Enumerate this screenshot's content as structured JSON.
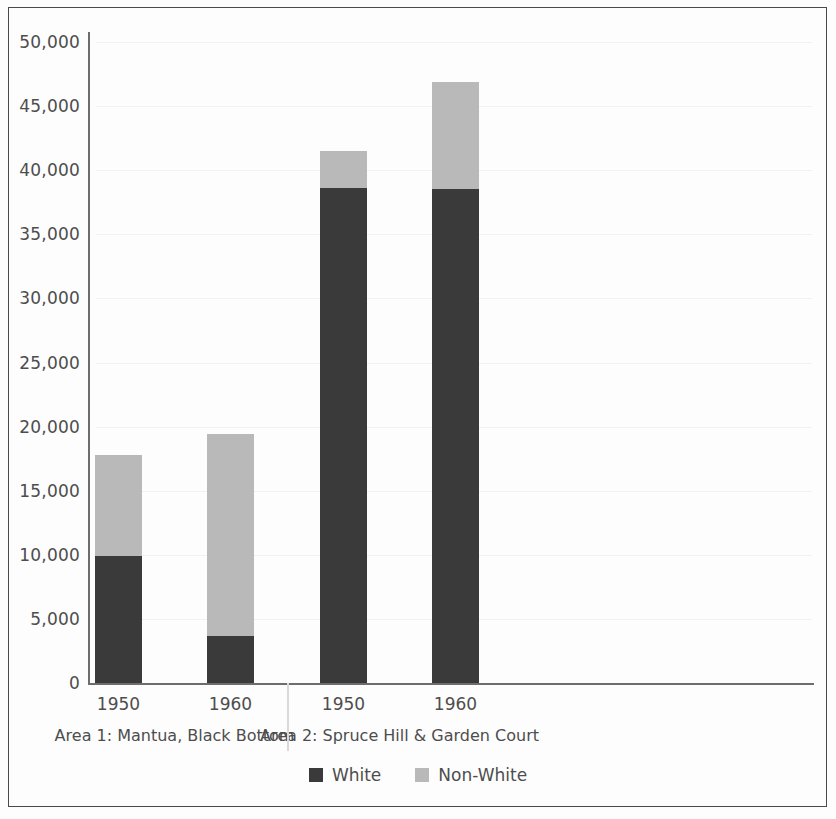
{
  "chart_data": {
    "type": "bar",
    "subtype": "stacked-bar-grouped",
    "title": "",
    "xlabel": "",
    "ylabel": "",
    "ylim": [
      0,
      50000
    ],
    "ytick_step": 5000,
    "ytick_labels": [
      "50,000",
      "45,000",
      "40,000",
      "35,000",
      "30,000",
      "25,000",
      "20,000",
      "15,000",
      "10,000",
      "5,000",
      "0"
    ],
    "ytick_values": [
      50000,
      45000,
      40000,
      35000,
      30000,
      25000,
      20000,
      15000,
      10000,
      5000,
      0
    ],
    "grid": true,
    "legend_position": "bottom-center",
    "categories": [
      "1950",
      "1960",
      "1950",
      "1960"
    ],
    "groups": [
      {
        "label": "Area 1: Mantua, Black Bottom",
        "categories": [
          "1950",
          "1960"
        ]
      },
      {
        "label": "Area 2: Spruce Hill & Garden Court",
        "categories": [
          "1950",
          "1960"
        ]
      }
    ],
    "series": [
      {
        "name": "White",
        "color": "#3a3a3a",
        "values": [
          9900,
          3700,
          38600,
          38500
        ]
      },
      {
        "name": "Non-White",
        "color": "#b9b9b9",
        "values": [
          7900,
          15700,
          2900,
          8400
        ]
      }
    ],
    "totals": [
      17800,
      19400,
      41500,
      46900
    ],
    "bars": [
      {
        "group": "Area 1: Mantua, Black Bottom",
        "category": "1950",
        "white": 9900,
        "non_white": 7900,
        "total": 17800
      },
      {
        "group": "Area 1: Mantua, Black Bottom",
        "category": "1960",
        "white": 3700,
        "non_white": 15700,
        "total": 19400
      },
      {
        "group": "Area 2: Spruce Hill & Garden Court",
        "category": "1950",
        "white": 38600,
        "non_white": 2900,
        "total": 41500
      },
      {
        "group": "Area 2: Spruce Hill & Garden Court",
        "category": "1960",
        "white": 38500,
        "non_white": 8400,
        "total": 46900
      }
    ]
  },
  "legend": {
    "items": [
      {
        "label": "White",
        "color": "#3a3a3a"
      },
      {
        "label": "Non-White",
        "color": "#b9b9b9"
      }
    ]
  },
  "axis": {
    "ticks": [
      {
        "label": "50,000"
      },
      {
        "label": "45,000"
      },
      {
        "label": "40,000"
      },
      {
        "label": "35,000"
      },
      {
        "label": "30,000"
      },
      {
        "label": "25,000"
      },
      {
        "label": "20,000"
      },
      {
        "label": "15,000"
      },
      {
        "label": "10,000"
      },
      {
        "label": "5,000"
      },
      {
        "label": "0"
      }
    ]
  },
  "xaxis": {
    "ticks": [
      {
        "label": "1950"
      },
      {
        "label": "1960"
      },
      {
        "label": "1950"
      },
      {
        "label": "1960"
      }
    ],
    "groups": [
      {
        "label": "Area 1: Mantua, Black Bottom"
      },
      {
        "label": "Area 2: Spruce Hill & Garden Court"
      }
    ]
  }
}
